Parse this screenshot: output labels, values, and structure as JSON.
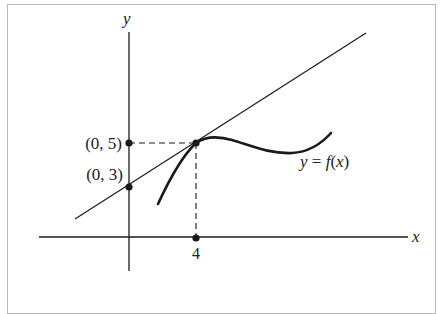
{
  "figure": {
    "axis_labels": {
      "x": "x",
      "y": "y"
    },
    "points": [
      {
        "label": "(0, 5)",
        "x": 0,
        "y": 5
      },
      {
        "label": "(0, 3)",
        "x": 0,
        "y": 3
      },
      {
        "label": "4",
        "x": 4,
        "y": 0
      }
    ],
    "curve_label": "y = f(x)",
    "curve_label_parts": {
      "y": "y",
      "eq": " = ",
      "f": "f",
      "open": "(",
      "x": "x",
      "close": ")"
    },
    "tangent_point": {
      "x": 4,
      "y": 5
    },
    "tangent_line": {
      "y_intercept": 3,
      "slope": 0.5
    },
    "colors": {
      "ink": "#1a1a1a",
      "frame": "#b8b8b8",
      "background": "#ffffff"
    }
  }
}
